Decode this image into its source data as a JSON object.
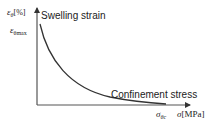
{
  "diagram": {
    "y_axis": {
      "label_symbol": "ε",
      "label_sub": "θ",
      "label_unit": "[%]",
      "max_label_symbol": "ε",
      "max_label_sub": "θmax"
    },
    "x_axis": {
      "label_symbol": "σ",
      "label_unit": "[MPa]",
      "critical_label_symbol": "σ",
      "critical_label_sub": "θc"
    },
    "annotations": {
      "curve_top": "Swelling strain",
      "curve_bottom": "Confinement stress"
    },
    "colors": {
      "line": "#333333",
      "background": "#ffffff"
    }
  }
}
